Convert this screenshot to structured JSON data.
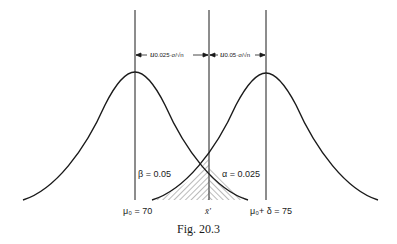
{
  "figure": {
    "caption": "Fig. 20.3",
    "beta_label": "β = 0.05",
    "alpha_label": "α = 0.025",
    "mu0_label": "μ₀ = 70",
    "xbar_label": "x̄'",
    "mu1_label": "μ₀+ δ = 75",
    "left_dim": {
      "u": "u",
      "sub": "0.025",
      "frac": "·σ/√n"
    },
    "right_dim": {
      "u": "u",
      "sub": "0.05",
      "frac": "·σ/√n"
    },
    "stroke_color": "#1a1a1a"
  }
}
